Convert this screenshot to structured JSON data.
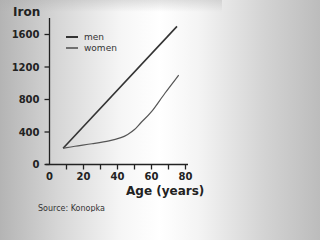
{
  "chart_data": {
    "type": "line",
    "title": "",
    "xlabel": "Age (years)",
    "ylabel": "Iron",
    "xlim": [
      0,
      80
    ],
    "ylim": [
      0,
      1800
    ],
    "xticks": [
      0,
      10,
      20,
      30,
      40,
      50,
      60,
      70,
      80
    ],
    "xtick_labels": [
      "0",
      "",
      "20",
      "",
      "40",
      "",
      "60",
      "",
      "80"
    ],
    "yticks": [
      0,
      400,
      800,
      1200,
      1600
    ],
    "ytick_labels": [
      "0",
      "400",
      "800",
      "1200",
      "1600"
    ],
    "grid": false,
    "legend_position": "top-left",
    "series": [
      {
        "name": "men",
        "color": "#333333",
        "x": [
          8,
          75
        ],
        "y": [
          200,
          1700
        ]
      },
      {
        "name": "women",
        "color": "#555555",
        "x": [
          8,
          15,
          25,
          35,
          42,
          46,
          50,
          54,
          60,
          68,
          76
        ],
        "y": [
          200,
          225,
          255,
          290,
          330,
          370,
          430,
          520,
          650,
          880,
          1100
        ]
      }
    ],
    "annotations": [
      "Source: Konopka"
    ]
  }
}
